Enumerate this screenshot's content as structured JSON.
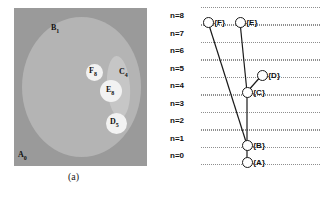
{
  "figure": {
    "panels": [
      {
        "id": "a",
        "caption": "(a)",
        "type": "grayscale-region-image",
        "regions": [
          {
            "name": "A",
            "subscript": "0",
            "label": "A",
            "role": "background-region",
            "shade": "#9a9a9a"
          },
          {
            "name": "B",
            "subscript": "1",
            "label": "B",
            "role": "large-ellipse-region",
            "shade": "#b4b4b4"
          },
          {
            "name": "C",
            "subscript": "4",
            "label": "C",
            "role": "elongated-blob-region",
            "shade": "#c6c6c6"
          },
          {
            "name": "F",
            "subscript": "8",
            "label": "F",
            "role": "small-bright-circle",
            "shade": "#f2f2f2"
          },
          {
            "name": "E",
            "subscript": "8",
            "label": "E",
            "role": "bright-circle",
            "shade": "#f2f2f2"
          },
          {
            "name": "D",
            "subscript": "5",
            "label": "D",
            "role": "bright-circle",
            "shade": "#f2f2f2"
          }
        ]
      },
      {
        "id": "b",
        "caption": "(b)",
        "type": "component-tree",
        "axis_label_prefix": "n=",
        "levels": [
          {
            "label": "n=8",
            "n": 8
          },
          {
            "label": "n=7",
            "n": 7
          },
          {
            "label": "n=6",
            "n": 6
          },
          {
            "label": "n=5",
            "n": 5
          },
          {
            "label": "n=4",
            "n": 4
          },
          {
            "label": "n=3",
            "n": 3
          },
          {
            "label": "n=2",
            "n": 2
          },
          {
            "label": "n=1",
            "n": 1
          },
          {
            "label": "n=0",
            "n": 0
          }
        ],
        "nodes": [
          {
            "id": "F",
            "label": "{F}",
            "n": 8,
            "x": 47,
            "y": 22
          },
          {
            "id": "E",
            "label": "{E}",
            "n": 8,
            "x": 79,
            "y": 22
          },
          {
            "id": "D",
            "label": "{D}",
            "n": 5,
            "x": 101,
            "y": 75
          },
          {
            "id": "C",
            "label": "{C}",
            "n": 4,
            "x": 86,
            "y": 92
          },
          {
            "id": "B",
            "label": "{B}",
            "n": 1,
            "x": 86,
            "y": 145
          },
          {
            "id": "A",
            "label": "{A}",
            "n": 0,
            "x": 86,
            "y": 162
          }
        ],
        "edges": [
          {
            "from": "F",
            "to": "B"
          },
          {
            "from": "E",
            "to": "C"
          },
          {
            "from": "D",
            "to": "C"
          },
          {
            "from": "C",
            "to": "B"
          },
          {
            "from": "B",
            "to": "A"
          }
        ]
      }
    ]
  },
  "colors": {
    "stroke": "#1a1a1a",
    "gridline": "#8e8e8e",
    "node_fill": "#ffffff",
    "background": "#ffffff"
  }
}
